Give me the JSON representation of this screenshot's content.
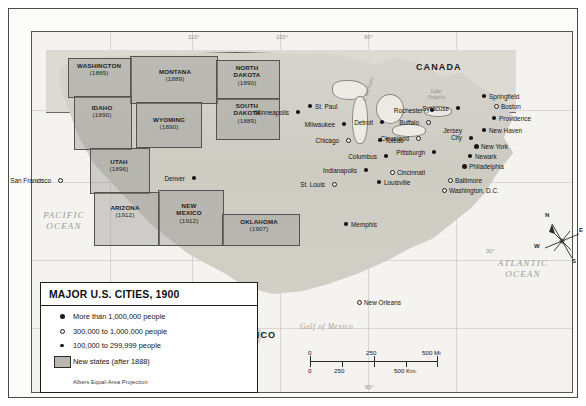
{
  "map": {
    "title": "MAJOR U.S. CITIES, 1900",
    "projection_note": "Albers Equal-Area Projection",
    "countries": [
      {
        "name": "CANADA"
      },
      {
        "name": "MEXICO"
      }
    ],
    "water_labels": {
      "pacific": "PACIFIC\nOCEAN",
      "pacific_line1": "PACIFIC",
      "pacific_line2": "OCEAN",
      "atlantic_line1": "ATLANTIC",
      "atlantic_line2": "OCEAN",
      "gulf": "Gulf of Mexico",
      "lake_ontario_line1": "Lake",
      "lake_ontario_line2": "Ontario",
      "lake_michigan": "L. Michigan"
    },
    "coords": {
      "top": [
        "110°",
        "100°",
        "90°"
      ],
      "right": [
        "30°"
      ],
      "bottom": [
        "90°"
      ],
      "left": [
        "40°"
      ]
    }
  },
  "legend": {
    "title": "MAJOR U.S. CITIES, 1900",
    "items": [
      {
        "symbol": "dot-lg",
        "label": "More than 1,000,000 people"
      },
      {
        "symbol": "dot-md",
        "label": "300,000 to 1,000,000 people"
      },
      {
        "symbol": "dot-sm",
        "label": "100,000 to 299,999 people"
      },
      {
        "symbol": "swatch",
        "label": "New states (after 1888)"
      }
    ],
    "projection": "Albers Equal-Area Projection"
  },
  "scale": {
    "miles": {
      "ticks": [
        "0",
        "250",
        "500 Mi"
      ]
    },
    "km": {
      "ticks": [
        "0",
        "250",
        "500 Km."
      ]
    }
  },
  "compass": {
    "north": "N",
    "east": "E",
    "south": "S",
    "west": "W"
  },
  "new_states": [
    {
      "name": "WASHINGTON",
      "year": "(1889)"
    },
    {
      "name": "MONTANA",
      "year": "(1889)"
    },
    {
      "name": "IDAHO",
      "year": "(1890)"
    },
    {
      "name": "WYOMING",
      "year": "(1890)"
    },
    {
      "name": "NORTH\nDAKOTA",
      "year": "(1890)"
    },
    {
      "name": "SOUTH\nDAKOTA",
      "year": "(1889)"
    },
    {
      "name": "UTAH",
      "year": "(1896)"
    },
    {
      "name": "ARIZONA",
      "year": "(1912)"
    },
    {
      "name": "NEW\nMEXICO",
      "year": "(1912)"
    },
    {
      "name": "OKLAHOMA",
      "year": "(1907)"
    }
  ],
  "state_labels": {
    "washington": {
      "l1": "WASHINGTON",
      "l2": "(1889)"
    },
    "montana": {
      "l1": "MONTANA",
      "l2": "(1889)"
    },
    "idaho": {
      "l1": "IDAHO",
      "l2": "(1890)"
    },
    "wyoming": {
      "l1": "WYOMING",
      "l2": "(1890)"
    },
    "north_dakota": {
      "l1": "NORTH",
      "l1b": "DAKOTA",
      "l2": "(1890)"
    },
    "south_dakota": {
      "l1": "SOUTH",
      "l1b": "DAKOTA",
      "l2": "(1889)"
    },
    "utah": {
      "l1": "UTAH",
      "l2": "(1896)"
    },
    "arizona": {
      "l1": "ARIZONA",
      "l2": "(1912)"
    },
    "new_mexico": {
      "l1": "NEW",
      "l1b": "MEXICO",
      "l2": "(1912)"
    },
    "oklahoma": {
      "l1": "OKLAHOMA",
      "l2": "(1907)"
    }
  },
  "cities": [
    {
      "name": "San Francisco",
      "size": "dot-md"
    },
    {
      "name": "Denver",
      "size": "dot-sm"
    },
    {
      "name": "Minneapolis",
      "size": "dot-sm"
    },
    {
      "name": "St. Paul",
      "size": "dot-sm"
    },
    {
      "name": "Milwaukee",
      "size": "dot-sm"
    },
    {
      "name": "Chicago",
      "size": "dot-md"
    },
    {
      "name": "Detroit",
      "size": "dot-sm"
    },
    {
      "name": "Toledo",
      "size": "dot-sm"
    },
    {
      "name": "Columbus",
      "size": "dot-sm"
    },
    {
      "name": "Indianapolis",
      "size": "dot-sm"
    },
    {
      "name": "St. Louis",
      "size": "dot-md"
    },
    {
      "name": "Louisville",
      "size": "dot-sm"
    },
    {
      "name": "Cincinnati",
      "size": "dot-md"
    },
    {
      "name": "Cleveland",
      "size": "dot-md"
    },
    {
      "name": "Pittsburgh",
      "size": "dot-sm"
    },
    {
      "name": "Buffalo",
      "size": "dot-md"
    },
    {
      "name": "Rochester",
      "size": "dot-sm"
    },
    {
      "name": "Syracuse",
      "size": "dot-sm"
    },
    {
      "name": "Springfield",
      "size": "dot-sm"
    },
    {
      "name": "Boston",
      "size": "dot-md"
    },
    {
      "name": "Providence",
      "size": "dot-sm"
    },
    {
      "name": "New Haven",
      "size": "dot-sm"
    },
    {
      "name": "Jersey City",
      "size": "dot-sm"
    },
    {
      "name": "New York",
      "size": "dot-lg"
    },
    {
      "name": "Newark",
      "size": "dot-sm"
    },
    {
      "name": "Philadelphia",
      "size": "dot-lg"
    },
    {
      "name": "Baltimore",
      "size": "dot-md"
    },
    {
      "name": "Washington, D.C.",
      "size": "dot-md"
    },
    {
      "name": "Memphis",
      "size": "dot-sm"
    },
    {
      "name": "New Orleans",
      "size": "dot-md"
    }
  ],
  "city_names": {
    "san_francisco": "San Francisco",
    "denver": "Denver",
    "minneapolis": "Minneapolis",
    "st_paul": "St. Paul",
    "milwaukee": "Milwaukee",
    "chicago": "Chicago",
    "detroit": "Detroit",
    "toledo": "Toledo",
    "columbus": "Columbus",
    "indianapolis": "Indianapolis",
    "st_louis": "St. Louis",
    "louisville": "Louisville",
    "cincinnati": "Cincinnati",
    "cleveland": "Cleveland",
    "pittsburgh": "Pittsburgh",
    "buffalo": "Buffalo",
    "rochester": "Rochester",
    "syracuse": "Syracuse",
    "springfield": "Springfield",
    "boston": "Boston",
    "providence": "Providence",
    "new_haven": "New Haven",
    "jersey_city_l1": "Jersey",
    "jersey_city_l2": "City",
    "new_york": "New York",
    "newark": "Newark",
    "philadelphia": "Philadelphia",
    "baltimore": "Baltimore",
    "washington_dc": "Washington, D.C.",
    "memphis": "Memphis",
    "new_orleans": "New Orleans"
  },
  "colors": {
    "land": "#cfcdc6",
    "newstate_tint": "#96968f",
    "water": "#f4f3ef",
    "ink": "#1a1a18",
    "frame": "#4a4a4a"
  }
}
